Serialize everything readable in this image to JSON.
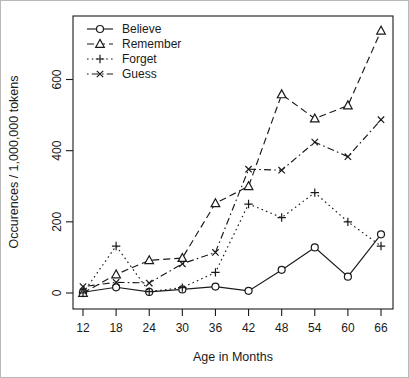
{
  "chart_data": {
    "type": "line",
    "title": "",
    "xlabel": "Age in Months",
    "ylabel": "Occurences / 1,000,000 tokens",
    "x": [
      12,
      18,
      24,
      30,
      36,
      42,
      48,
      54,
      60,
      66
    ],
    "x_ticks": [
      12,
      18,
      24,
      30,
      36,
      42,
      48,
      54,
      60,
      66
    ],
    "y_ticks": [
      0,
      200,
      400,
      600
    ],
    "ylim": [
      0,
      740
    ],
    "xlim": [
      12,
      66
    ],
    "grid": false,
    "legend_position": "top-left-inside",
    "line_color": "#1a1a1a",
    "background_color": "#ffffff",
    "series": [
      {
        "name": "Believe",
        "marker": "circle",
        "linestyle": "solid",
        "values": [
          2,
          16,
          3,
          10,
          18,
          6,
          65,
          128,
          46,
          165
        ]
      },
      {
        "name": "Remember",
        "marker": "triangle",
        "linestyle": "dashed",
        "values": [
          0,
          52,
          92,
          98,
          252,
          300,
          558,
          490,
          527,
          737
        ]
      },
      {
        "name": "Forget",
        "marker": "plus",
        "linestyle": "dotted",
        "values": [
          0,
          132,
          4,
          15,
          58,
          250,
          212,
          282,
          200,
          132
        ]
      },
      {
        "name": "Guess",
        "marker": "x",
        "linestyle": "dashdot",
        "values": [
          18,
          30,
          28,
          82,
          114,
          348,
          345,
          424,
          383,
          487
        ]
      }
    ]
  }
}
